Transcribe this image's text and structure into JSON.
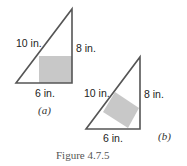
{
  "figure": {
    "caption": "Figure 4.7.5",
    "colors": {
      "stroke": "#555555",
      "fill": "#c8c8c8",
      "background": "#ffffff"
    },
    "panels": [
      {
        "id": "a",
        "sublabel": "(a)",
        "hypotenuse_label": "10 in.",
        "height_label": "8 in.",
        "base_label": "6 in.",
        "inscribed_square": "axis-aligned, sharing the right angle corner"
      },
      {
        "id": "b",
        "sublabel": "(b)",
        "hypotenuse_label": "10 in.",
        "height_label": "8 in.",
        "base_label": "6 in.",
        "inscribed_square": "rotated, one side on the hypotenuse"
      }
    ]
  }
}
